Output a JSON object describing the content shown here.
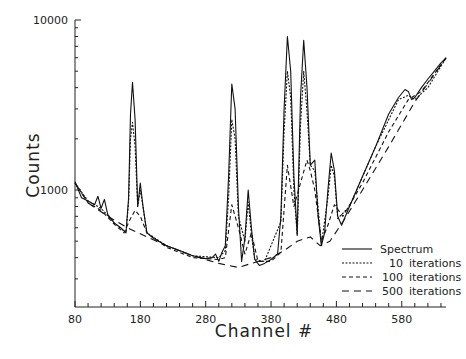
{
  "chart_data": {
    "type": "line",
    "title": "",
    "xlabel": "Channel #",
    "ylabel": "Counts",
    "yscale": "log",
    "xlim": [
      80,
      648
    ],
    "ylim": [
      200,
      10000
    ],
    "x_ticks": [
      80,
      180,
      280,
      380,
      480,
      580
    ],
    "y_ticks": [
      1000,
      10000
    ],
    "grid": false,
    "legend_position": "lower right",
    "series": [
      {
        "name": "Spectrum",
        "style": "solid",
        "x": [
          80,
          90,
          100,
          110,
          115,
          120,
          125,
          130,
          140,
          150,
          158,
          162,
          165,
          168,
          172,
          176,
          180,
          184,
          190,
          200,
          220,
          240,
          260,
          280,
          290,
          295,
          300,
          305,
          310,
          315,
          320,
          325,
          330,
          335,
          340,
          345,
          350,
          355,
          362,
          370,
          380,
          390,
          395,
          400,
          405,
          410,
          415,
          420,
          425,
          430,
          435,
          440,
          447,
          452,
          457,
          462,
          467,
          472,
          477,
          482,
          488,
          500,
          520,
          540,
          560,
          575,
          585,
          590,
          595,
          600,
          610,
          620,
          630,
          640,
          648
        ],
        "y": [
          1120,
          900,
          860,
          820,
          920,
          780,
          880,
          720,
          640,
          600,
          560,
          900,
          2800,
          4300,
          2600,
          800,
          1100,
          800,
          560,
          520,
          470,
          440,
          410,
          395,
          400,
          420,
          380,
          430,
          470,
          1200,
          4200,
          3000,
          800,
          380,
          520,
          1000,
          600,
          390,
          360,
          370,
          390,
          420,
          700,
          3000,
          8000,
          5000,
          1200,
          550,
          3500,
          7600,
          4000,
          1400,
          1500,
          700,
          470,
          560,
          1000,
          1650,
          1300,
          700,
          620,
          800,
          1200,
          1800,
          2800,
          3500,
          3900,
          3800,
          3400,
          3500,
          4000,
          4500,
          5000,
          5600,
          6000
        ]
      },
      {
        "name": "10 iterations",
        "style": "dotted",
        "x": [
          80,
          100,
          120,
          140,
          158,
          162,
          165,
          168,
          172,
          176,
          180,
          184,
          190,
          220,
          260,
          300,
          310,
          315,
          320,
          325,
          330,
          340,
          345,
          350,
          355,
          370,
          395,
          400,
          405,
          410,
          415,
          420,
          425,
          430,
          435,
          440,
          447,
          457,
          467,
          472,
          477,
          482,
          500,
          540,
          575,
          590,
          600,
          620,
          648
        ],
        "y": [
          1100,
          860,
          780,
          640,
          560,
          850,
          2000,
          2500,
          1800,
          800,
          1000,
          800,
          560,
          470,
          410,
          400,
          440,
          900,
          2600,
          2000,
          700,
          500,
          850,
          550,
          390,
          380,
          650,
          2200,
          5000,
          3500,
          1000,
          540,
          2400,
          5000,
          2900,
          1400,
          1300,
          480,
          900,
          1400,
          1200,
          680,
          800,
          1800,
          3400,
          3600,
          3400,
          4000,
          6000
        ]
      },
      {
        "name": "100 iterations",
        "style": "dashed",
        "x": [
          80,
          100,
          120,
          140,
          155,
          165,
          172,
          180,
          190,
          220,
          260,
          300,
          310,
          320,
          330,
          340,
          350,
          360,
          380,
          395,
          405,
          415,
          425,
          435,
          440,
          447,
          457,
          467,
          477,
          490,
          520,
          560,
          590,
          610,
          648
        ],
        "y": [
          1100,
          840,
          760,
          630,
          560,
          680,
          760,
          700,
          560,
          460,
          400,
          390,
          400,
          820,
          600,
          420,
          560,
          380,
          380,
          430,
          1400,
          800,
          1100,
          1500,
          1300,
          1000,
          500,
          620,
          820,
          700,
          1100,
          2200,
          3400,
          3800,
          6000
        ]
      },
      {
        "name": "500 iterations",
        "style": "long-dashed",
        "x": [
          80,
          100,
          130,
          160,
          190,
          220,
          260,
          300,
          330,
          350,
          380,
          400,
          420,
          440,
          455,
          470,
          490,
          520,
          560,
          600,
          648
        ],
        "y": [
          1100,
          840,
          700,
          600,
          530,
          470,
          410,
          370,
          350,
          370,
          400,
          440,
          500,
          530,
          470,
          500,
          650,
          1000,
          1800,
          3300,
          6000
        ]
      }
    ]
  },
  "axes": {
    "xlabel": "Channel #",
    "ylabel": "Counts",
    "x_tick_labels": [
      "80",
      "180",
      "280",
      "380",
      "480",
      "580"
    ],
    "y_tick_labels": [
      "10000",
      "1000"
    ]
  },
  "legend": {
    "items": [
      {
        "label": "Spectrum",
        "count": ""
      },
      {
        "label": "10",
        "count": "iterations"
      },
      {
        "label": "100",
        "count": "iterations"
      },
      {
        "label": "500",
        "count": "iterations"
      }
    ]
  }
}
